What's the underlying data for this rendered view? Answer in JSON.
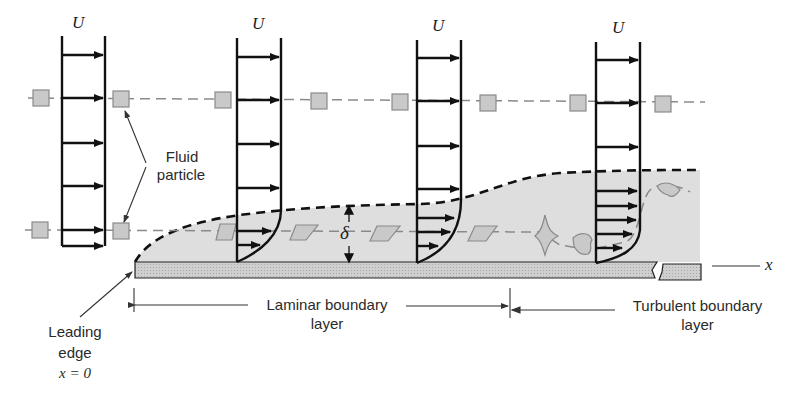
{
  "diagram": {
    "profile_label": "U",
    "labels": {
      "fluid_particle": [
        "Fluid",
        "particle"
      ],
      "delta": "δ",
      "x_axis": "x",
      "leading_edge": [
        "Leading",
        "edge",
        "x = 0"
      ],
      "laminar": [
        "Laminar boundary",
        "layer"
      ],
      "turbulent": [
        "Turbulent boundary",
        "layer"
      ]
    },
    "colors": {
      "ink": "#111111",
      "boundary_fill": "#dcdcdc",
      "plate_fill": "#c8c8c8",
      "particle_fill": "#c9c9c9",
      "dash_line": "#8a8a8a"
    },
    "profiles": [
      {
        "name": "uniform-inlet",
        "x": 62,
        "type": "uniform"
      },
      {
        "name": "laminar-1",
        "x": 237,
        "type": "laminar"
      },
      {
        "name": "laminar-2",
        "x": 417,
        "type": "laminar"
      },
      {
        "name": "turbulent",
        "x": 596,
        "type": "turbulent"
      }
    ]
  }
}
